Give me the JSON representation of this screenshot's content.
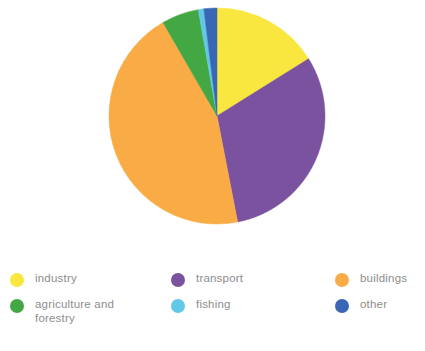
{
  "chart_data": {
    "type": "pie",
    "title": "",
    "subtitle": "",
    "legend_position": "bottom",
    "grid": false,
    "categories": [
      "industry",
      "transport",
      "buildings",
      "agriculture and forestry",
      "fishing",
      "other"
    ],
    "values": [
      16.1,
      30.8,
      44.7,
      5.6,
      0.8,
      2.0
    ],
    "unit": "%",
    "start_angle_deg": 0,
    "direction": "clockwise",
    "slices": [
      {
        "label": "industry",
        "value": 16.1,
        "color": "#f9e73f",
        "start_deg": 0,
        "end_deg": 58
      },
      {
        "label": "transport",
        "value": 30.8,
        "color": "#7b529f",
        "start_deg": 58,
        "end_deg": 169
      },
      {
        "label": "buildings",
        "value": 44.7,
        "color": "#f9ab45",
        "start_deg": 169,
        "end_deg": 330
      },
      {
        "label": "agriculture and forestry",
        "value": 5.6,
        "color": "#43a843",
        "start_deg": 330,
        "end_deg": 350
      },
      {
        "label": "fishing",
        "value": 0.8,
        "color": "#63c8e8",
        "start_deg": 350,
        "end_deg": 353
      },
      {
        "label": "other",
        "value": 2.0,
        "color": "#3a67b5",
        "start_deg": 353,
        "end_deg": 360
      }
    ],
    "xlabel": "",
    "ylabel": ""
  },
  "legend": {
    "rows": [
      [
        {
          "label": "industry",
          "color": "#f9e73f",
          "icon": "legend-swatch-industry"
        },
        {
          "label": "transport",
          "color": "#7b529f",
          "icon": "legend-swatch-transport"
        },
        {
          "label": "buildings",
          "color": "#f9ab45",
          "icon": "legend-swatch-buildings"
        }
      ],
      [
        {
          "label": "agriculture and\nforestry",
          "color": "#43a843",
          "icon": "legend-swatch-agriculture-and-forestry"
        },
        {
          "label": "fishing",
          "color": "#63c8e8",
          "icon": "legend-swatch-fishing"
        },
        {
          "label": "other",
          "color": "#3a67b5",
          "icon": "legend-swatch-other"
        }
      ]
    ]
  },
  "colors": {
    "background": "#ffffff",
    "legend_text": "#8d8d8d",
    "industry": "#f9e73f",
    "transport": "#7b529f",
    "buildings": "#f9ab45",
    "agriculture": "#43a843",
    "fishing": "#63c8e8",
    "other": "#3a67b5"
  }
}
